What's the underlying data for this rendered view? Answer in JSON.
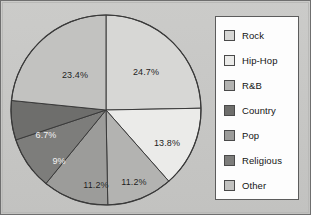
{
  "colors": {
    "background": "#c6c6c4",
    "frame_border": "#6f6f6f",
    "legend_background": "#fdfdfd",
    "legend_border": "#5c5c5c",
    "slice_outline": "#3a3a3a",
    "label_dark": "#1b1b1b",
    "label_light": "#f2f2f2"
  },
  "legend": {
    "items": [
      {
        "label": "Rock",
        "color": "#d7d7d5"
      },
      {
        "label": "Hip-Hop",
        "color": "#ebebe9"
      },
      {
        "label": "R&B",
        "color": "#b3b3b1"
      },
      {
        "label": "Country",
        "color": "#6e6e6c"
      },
      {
        "label": "Pop",
        "color": "#9c9c9a"
      },
      {
        "label": "Religious",
        "color": "#7d7d7b"
      },
      {
        "label": "Other",
        "color": "#c2c2c0"
      }
    ]
  },
  "chart_data": {
    "type": "pie",
    "title": "",
    "xlabel": "",
    "ylabel": "",
    "grid": false,
    "legend_position": "right",
    "start_angle_deg": 0,
    "direction": "clockwise",
    "center": {
      "x": 97,
      "y": 97
    },
    "radius": 95,
    "labels": [
      "Rock",
      "Hip-Hop",
      "R&B",
      "Country",
      "Pop",
      "Religious",
      "Other"
    ],
    "values": [
      24.7,
      13.8,
      11.2,
      11.2,
      9,
      6.7,
      23.4
    ],
    "value_unit": "%",
    "slices": [
      {
        "name": "Rock",
        "value": 24.7,
        "data_label": "24.7%",
        "color": "#d7d7d5",
        "label_pos": {
          "x": 137,
          "y": 59
        },
        "label_style": "dark"
      },
      {
        "name": "Hip-Hop",
        "value": 13.8,
        "data_label": "13.8%",
        "color": "#ebebe9",
        "label_pos": {
          "x": 158,
          "y": 130
        },
        "label_style": "dark"
      },
      {
        "name": "R&B",
        "value": 11.2,
        "data_label": "11.2%",
        "color": "#b3b3b1",
        "label_pos": {
          "x": 125,
          "y": 169
        },
        "label_style": "dark"
      },
      {
        "name": "Country",
        "value": 11.2,
        "data_label": "11.2%",
        "color": "#9c9c9a",
        "label_pos": {
          "x": 87,
          "y": 172
        },
        "label_style": "dark"
      },
      {
        "name": "Pop",
        "value": 9,
        "data_label": "9%",
        "color": "#7d7d7b",
        "label_pos": {
          "x": 50,
          "y": 148
        },
        "label_style": "light"
      },
      {
        "name": "Religious",
        "value": 6.7,
        "data_label": "6.7%",
        "color": "#6e6e6c",
        "label_pos": {
          "x": 37,
          "y": 122
        },
        "label_style": "light"
      },
      {
        "name": "Other",
        "value": 23.4,
        "data_label": "23.4%",
        "color": "#c2c2c0",
        "label_pos": {
          "x": 66,
          "y": 62
        },
        "label_style": "dark"
      }
    ]
  }
}
